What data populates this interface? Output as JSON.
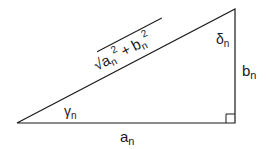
{
  "diagram": {
    "type": "right-triangle",
    "vertices": {
      "left": [
        17,
        123
      ],
      "right_angle": [
        235,
        123
      ],
      "top": [
        235,
        9
      ]
    },
    "labels": {
      "base": {
        "main": "a",
        "sub": "n"
      },
      "height": {
        "main": "b",
        "sub": "n"
      },
      "angle_left": {
        "main": "γ",
        "sub": "n"
      },
      "angle_top": {
        "main": "δ",
        "sub": "n"
      },
      "hypotenuse": {
        "radical": "√",
        "term1_main": "a",
        "term1_sub": "n",
        "term1_sup": "2",
        "plus": "+",
        "term2_main": "b",
        "term2_sub": "n",
        "term2_sup": "2"
      }
    },
    "colors": {
      "stroke": "#1a1a1a",
      "background": "#ffffff"
    }
  }
}
